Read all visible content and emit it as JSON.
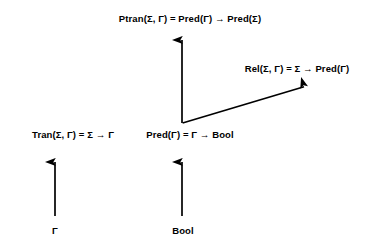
{
  "diagram": {
    "background_color": "#ffffff",
    "stroke_color": "#000000",
    "labels": {
      "ptran": "Ptran(Σ, Γ) =  Pred(Γ) → Pred(Σ)",
      "rel": "Rel(Σ, Γ) = Σ → Pred(Γ)",
      "tran": "Tran(Σ, Γ) = Σ →  Γ",
      "pred": "Pred(Γ) = Γ → Bool",
      "gamma": "Γ",
      "bool": "Bool"
    },
    "arrows": [
      {
        "name": "pred-to-ptran-arrow",
        "from": [
          182,
          123
        ],
        "to": [
          182,
          34
        ],
        "orientation": "vertical-up"
      },
      {
        "name": "pred-to-rel-arrow",
        "from": [
          182,
          123
        ],
        "to": [
          311,
          85
        ],
        "orientation": "diagonal-up-right"
      },
      {
        "name": "gamma-to-tran-arrow",
        "from": [
          55,
          216
        ],
        "to": [
          55,
          156
        ],
        "orientation": "vertical-up"
      },
      {
        "name": "bool-to-pred-arrow",
        "from": [
          182,
          216
        ],
        "to": [
          182,
          156
        ],
        "orientation": "vertical-up"
      }
    ]
  }
}
